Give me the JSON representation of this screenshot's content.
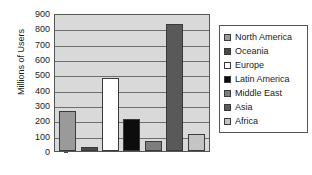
{
  "chart_data": {
    "type": "bar",
    "title": "",
    "xlabel": "",
    "ylabel": "Millions of Users",
    "ylim": [
      0,
      900
    ],
    "ytick_step": 100,
    "yticks": [
      900,
      800,
      700,
      600,
      500,
      400,
      300,
      200,
      100,
      0
    ],
    "grid": true,
    "legend_position": "right",
    "categories": [
      "North America",
      "Oceania",
      "Europe",
      "Latin America",
      "Middle East",
      "Asia",
      "Africa"
    ],
    "values": [
      262,
      27,
      478,
      207,
      67,
      830,
      112
    ],
    "colors": [
      "#9a9a9a",
      "#4a4a4a",
      "#ffffff",
      "#0d0d0d",
      "#7d7d7d",
      "#595959",
      "#c4c4c4"
    ],
    "plot_background": "#d9d9d9",
    "axis_color": "#555555",
    "gridline_color": "#6e6e6e"
  },
  "legend": {
    "items": [
      {
        "label": "North America",
        "swatch": "#9a9a9a"
      },
      {
        "label": "Oceania",
        "swatch": "#4a4a4a"
      },
      {
        "label": "Europe",
        "swatch": "#ffffff"
      },
      {
        "label": "Latin America",
        "swatch": "#0d0d0d"
      },
      {
        "label": "Middle East",
        "swatch": "#7d7d7d"
      },
      {
        "label": "Asia",
        "swatch": "#595959"
      },
      {
        "label": "Africa",
        "swatch": "#c4c4c4"
      }
    ]
  }
}
